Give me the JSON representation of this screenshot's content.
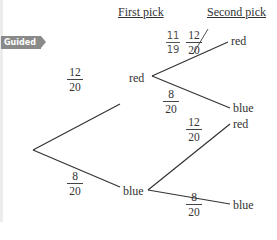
{
  "badge": "Guided",
  "headers": {
    "first": "First pick",
    "second": "Second pick"
  },
  "nodes": {
    "first_red": "red",
    "first_blue": "blue",
    "red_red": "red",
    "red_blue": "blue",
    "blue_red": "red",
    "blue_blue": "blue"
  },
  "probabilities": {
    "root_red": {
      "num": "12",
      "den": "20"
    },
    "root_blue": {
      "num": "8",
      "den": "20"
    },
    "red_red": {
      "num": "12",
      "den": "20",
      "crossed_out": true
    },
    "red_red_correction": {
      "num": "11",
      "den": "19"
    },
    "red_blue": {
      "num": "8",
      "den": "20"
    },
    "blue_red": {
      "num": "12",
      "den": "20"
    },
    "blue_blue": {
      "num": "8",
      "den": "20"
    }
  }
}
